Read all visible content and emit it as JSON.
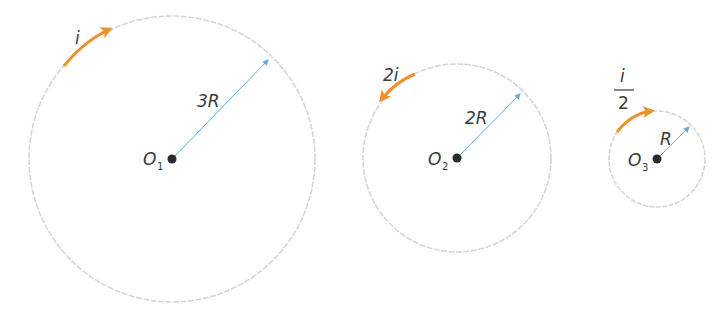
{
  "diagram": {
    "colors": {
      "circle": "#d6d6d6",
      "radius": "#5aaee8",
      "current_arrow": "#f0902a",
      "center_dot": "#2b2b2b",
      "text": "#3a3a3a"
    },
    "loops": [
      {
        "center_label": "O",
        "center_subscript": "1",
        "radius_label": "3R",
        "current_label": "i",
        "current_direction": "clockwise"
      },
      {
        "center_label": "O",
        "center_subscript": "2",
        "radius_label": "2R",
        "current_label": "2i",
        "current_direction": "counterclockwise"
      },
      {
        "center_label": "O",
        "center_subscript": "3",
        "radius_label": "R",
        "current_label_numerator": "i",
        "current_label_denominator": "2",
        "current_direction": "clockwise"
      }
    ]
  }
}
